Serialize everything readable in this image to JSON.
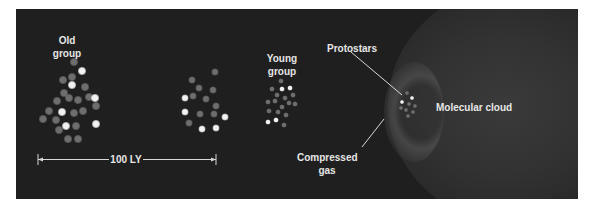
{
  "diagram": {
    "background_color": "#1f1f1f",
    "text_color": "#e6e6e6",
    "labels": {
      "old_group": [
        "Old",
        "group"
      ],
      "young_group": [
        "Young",
        "group"
      ],
      "protostars": "Protostars",
      "molecular_cloud": "Molecular cloud",
      "compressed_gas": [
        "Compressed",
        "gas"
      ],
      "scale_bar": "100 LY"
    },
    "groups": [
      {
        "name": "Old group",
        "star_count": 23
      },
      {
        "name": "Intermediate group",
        "star_count": 16
      },
      {
        "name": "Young group",
        "star_count": 17
      },
      {
        "name": "Protostars",
        "star_count": 9
      }
    ]
  }
}
